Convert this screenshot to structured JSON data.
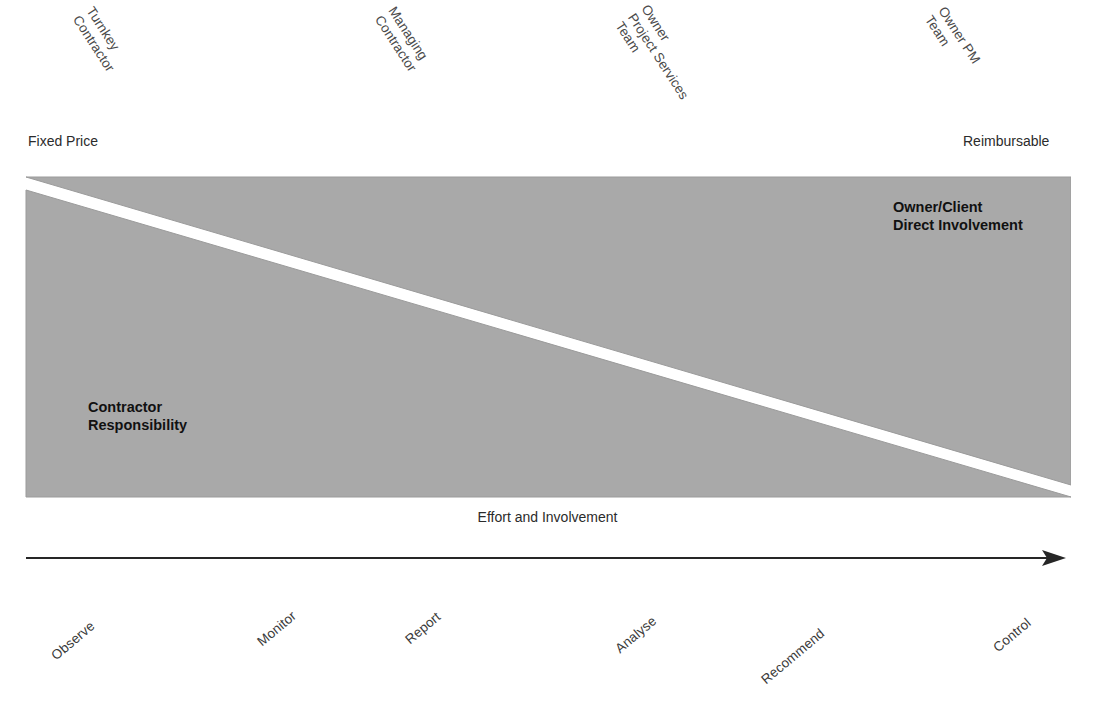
{
  "diagram": {
    "colors": {
      "wedge_fill": "#a9a9a9",
      "wedge_edge": "#8f8f8f",
      "divider_band": "#ffffff",
      "arrow": "#262626",
      "label_text": "#4a4a4a",
      "bold_text": "#111111"
    },
    "top_role_labels": [
      {
        "id": "turnkey-contractor",
        "lines": "Turnkey\nContractor",
        "x": 96,
        "y": 4
      },
      {
        "id": "managing-contractor",
        "lines": "Managing\nContractor",
        "x": 398,
        "y": 4
      },
      {
        "id": "owner-project-services-team",
        "lines": "Owner\nProject Services\nTeam",
        "x": 651,
        "y": 2
      },
      {
        "id": "owner-pm-team",
        "lines": "Owner PM\nTeam",
        "x": 948,
        "y": 4
      }
    ],
    "end_labels": {
      "left": {
        "text": "Fixed Price",
        "x": 28,
        "y": 133
      },
      "right": {
        "text": "Reimbursable",
        "x": 963,
        "y": 133
      }
    },
    "wedge_labels": {
      "upper": "Owner/Client\nDirect Involvement",
      "lower": "Contractor\nResponsibility"
    },
    "axis": {
      "caption": "Effort and Involvement",
      "arrow_direction": "right"
    },
    "bottom_stage_labels": [
      {
        "id": "observe",
        "text": "Observe",
        "x": 58,
        "y": 648
      },
      {
        "id": "monitor",
        "text": "Monitor",
        "x": 264,
        "y": 634
      },
      {
        "id": "report",
        "text": "Report",
        "x": 412,
        "y": 632
      },
      {
        "id": "analyse",
        "text": "Analyse",
        "x": 622,
        "y": 641
      },
      {
        "id": "recommend",
        "text": "Recommend",
        "x": 768,
        "y": 672
      },
      {
        "id": "control",
        "text": "Control",
        "x": 1000,
        "y": 640
      }
    ],
    "geometry": {
      "wedge_left": 25,
      "wedge_top": 176,
      "wedge_right": 1071,
      "wedge_bottom": 498
    }
  }
}
